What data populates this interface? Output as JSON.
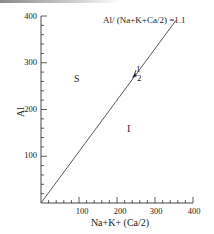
{
  "chart_data": {
    "type": "line",
    "title": "",
    "xlabel": "Na+K+(Ca/2)",
    "ylabel": "Al",
    "xlim": [
      0,
      400
    ],
    "ylim": [
      0,
      400
    ],
    "x_ticks": [
      100,
      200,
      300,
      400
    ],
    "y_ticks": [
      100,
      200,
      300,
      400
    ],
    "x_minor_step": 20,
    "y_minor_step": 20,
    "grid": false,
    "series": [
      {
        "name": "Al/(Na+K+Ca/2)=1.1",
        "x": [
          0,
          355
        ],
        "y": [
          0,
          390.5
        ]
      }
    ],
    "annotations": [
      {
        "text": "Al/ (Na+K+Ca/2) =1.1",
        "x": 215,
        "y": 375
      },
      {
        "text": "S",
        "x": 95,
        "y": 268
      },
      {
        "text": "I",
        "x": 232,
        "y": 160
      },
      {
        "text": "1",
        "x": 250,
        "y": 278,
        "marker": "arrow"
      },
      {
        "text": "2",
        "x": 250,
        "y": 258
      }
    ]
  },
  "labels": {
    "xlabel": "Na+K+ (Ca/2)",
    "ylabel": "Al",
    "equation": "Al/ (Na+K+Ca/2) =1.1",
    "region_s": "S",
    "region_i": "I",
    "marker_1": "1",
    "marker_2": "2",
    "xtick_100": "100",
    "xtick_200": "200",
    "xtick_300": "300",
    "xtick_400": "400",
    "ytick_100": "100",
    "ytick_200": "200",
    "ytick_300": "300",
    "ytick_400": "400"
  }
}
